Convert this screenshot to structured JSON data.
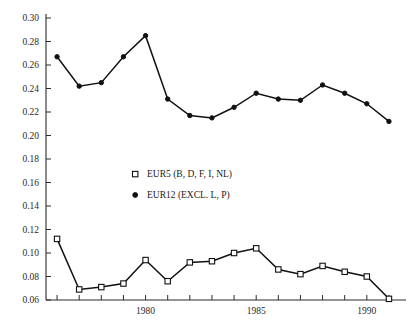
{
  "chart_data": {
    "type": "line",
    "title": "",
    "subtitle": "",
    "xlabel": "",
    "ylabel": "",
    "xlim": [
      1975.5,
      1991.5
    ],
    "ylim": [
      0.06,
      0.3
    ],
    "grid": false,
    "legend_position": "center",
    "y_ticks": [
      "0.30",
      "0.28",
      "0.26",
      "0.24",
      "0.22",
      "0.20",
      "0.18",
      "0.16",
      "0.14",
      "0.12",
      "0.10",
      "0.08",
      "0.06"
    ],
    "y_tick_values": [
      0.3,
      0.28,
      0.26,
      0.24,
      0.22,
      0.2,
      0.18,
      0.16,
      0.14,
      0.12,
      0.1,
      0.08,
      0.06
    ],
    "x_tick_values": [
      1976,
      1977,
      1978,
      1979,
      1980,
      1981,
      1982,
      1983,
      1984,
      1985,
      1986,
      1987,
      1988,
      1989,
      1990,
      1991
    ],
    "x_labeled_ticks": [
      {
        "value": 1980,
        "label": "1980"
      },
      {
        "value": 1985,
        "label": "1985"
      },
      {
        "value": 1990,
        "label": "1990"
      }
    ],
    "x": [
      1976,
      1977,
      1978,
      1979,
      1980,
      1981,
      1982,
      1983,
      1984,
      1985,
      1986,
      1987,
      1988,
      1989,
      1990,
      1991
    ],
    "series": [
      {
        "name": "EUR5 (B, D, F, I, NL)",
        "marker": "open-square",
        "values": [
          0.112,
          0.069,
          0.071,
          0.074,
          0.094,
          0.076,
          0.092,
          0.093,
          0.1,
          0.104,
          0.086,
          0.082,
          0.089,
          0.084,
          0.08,
          0.061
        ]
      },
      {
        "name": "EUR12 (EXCL. L, P)",
        "marker": "filled-circle",
        "values": [
          0.267,
          0.242,
          0.245,
          0.267,
          0.285,
          0.231,
          0.217,
          0.215,
          0.224,
          0.236,
          0.231,
          0.23,
          0.243,
          0.236,
          0.227,
          0.212
        ]
      }
    ]
  },
  "legend": {
    "entries": [
      {
        "marker": "open-square",
        "label": "EUR5 (B, D, F, I, NL)"
      },
      {
        "marker": "filled-circle",
        "label": "EUR12 (EXCL. L, P)"
      }
    ]
  }
}
